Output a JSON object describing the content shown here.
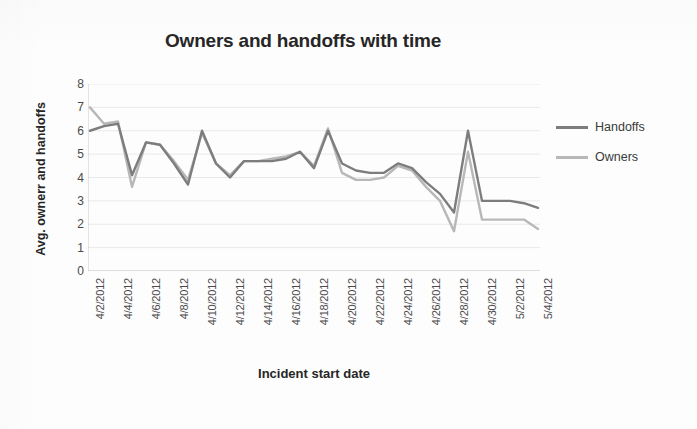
{
  "chart_data": {
    "type": "line",
    "title": "Owners and handoffs with time",
    "xlabel": "Incident start date",
    "ylabel": "Avg. ownerr and handoffs",
    "ylim": [
      0,
      8
    ],
    "ytick_step": 1,
    "yticks": [
      "8",
      "7",
      "6",
      "5",
      "4",
      "3",
      "2",
      "1",
      "0"
    ],
    "grid": true,
    "grid_axis": "y",
    "legend_position": "right",
    "categories": [
      "4/2/2012",
      "4/3/2012",
      "4/4/2012",
      "4/5/2012",
      "4/6/2012",
      "4/7/2012",
      "4/8/2012",
      "4/9/2012",
      "4/10/2012",
      "4/11/2012",
      "4/12/2012",
      "4/13/2012",
      "4/14/2012",
      "4/15/2012",
      "4/16/2012",
      "4/17/2012",
      "4/18/2012",
      "4/19/2012",
      "4/20/2012",
      "4/21/2012",
      "4/22/2012",
      "4/23/2012",
      "4/24/2012",
      "4/25/2012",
      "4/26/2012",
      "4/27/2012",
      "4/28/2012",
      "4/29/2012",
      "4/30/2012",
      "5/1/2012",
      "5/2/2012",
      "5/3/2012",
      "5/4/2012"
    ],
    "tick_labels": [
      "4/2/2012",
      "4/4/2012",
      "4/6/2012",
      "4/8/2012",
      "4/10/2012",
      "4/12/2012",
      "4/14/2012",
      "4/16/2012",
      "4/18/2012",
      "4/20/2012",
      "4/22/2012",
      "4/24/2012",
      "4/26/2012",
      "4/28/2012",
      "4/30/2012",
      "5/2/2012",
      "5/4/2012"
    ],
    "tick_label_interval": 2,
    "series": [
      {
        "name": "Handoffs",
        "color": "#7d7d7d",
        "values": [
          6.0,
          6.2,
          6.3,
          4.1,
          5.5,
          5.4,
          4.6,
          3.7,
          6.0,
          4.6,
          4.0,
          4.7,
          4.7,
          4.7,
          4.8,
          5.1,
          4.4,
          6.0,
          4.6,
          4.3,
          4.2,
          4.2,
          4.6,
          4.4,
          3.8,
          3.3,
          2.5,
          6.0,
          3.0,
          3.0,
          3.0,
          2.9,
          2.7
        ]
      },
      {
        "name": "Owners",
        "color": "#b8b8b8",
        "values": [
          7.0,
          6.3,
          6.4,
          3.6,
          5.5,
          5.4,
          4.7,
          3.9,
          5.9,
          4.6,
          4.1,
          4.7,
          4.7,
          4.8,
          4.9,
          5.1,
          4.5,
          6.1,
          4.2,
          3.9,
          3.9,
          4.0,
          4.5,
          4.3,
          3.6,
          3.0,
          1.7,
          5.1,
          2.2,
          2.2,
          2.2,
          2.2,
          1.8
        ]
      }
    ]
  },
  "legend": {
    "items": [
      {
        "label": "Handoffs",
        "color": "#7d7d7d"
      },
      {
        "label": "Owners",
        "color": "#b8b8b8"
      }
    ]
  }
}
